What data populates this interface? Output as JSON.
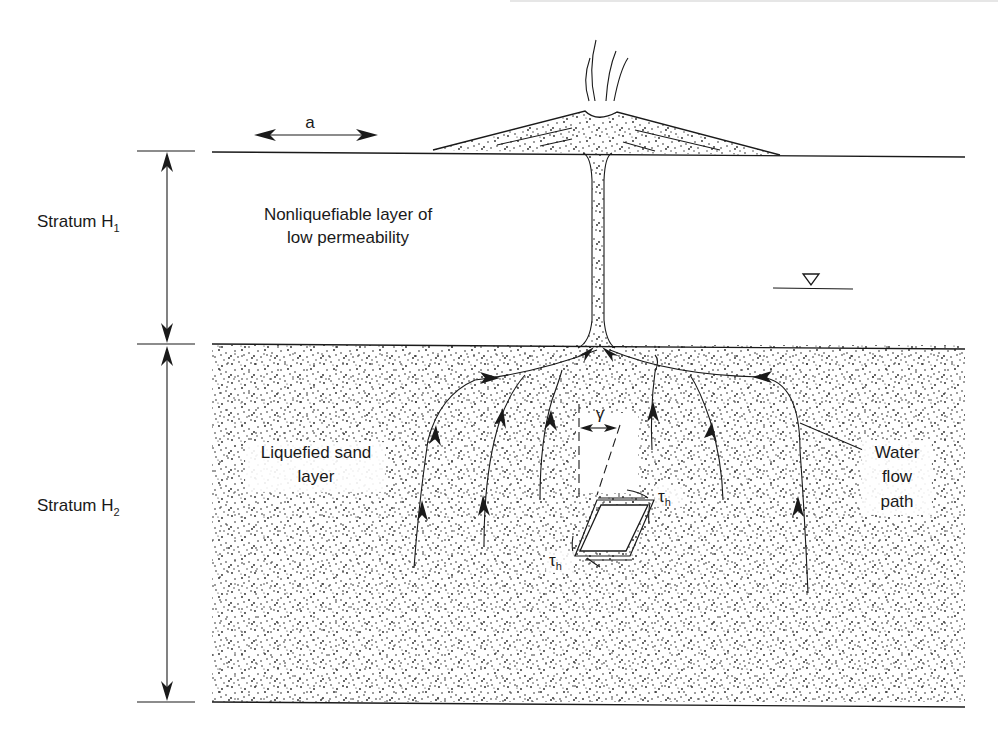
{
  "figure": {
    "type": "geotechnical cross-section"
  },
  "labels": {
    "width_dimension": "a",
    "stratum_h1": {
      "text": "Stratum H",
      "subscript": "1"
    },
    "stratum_h2": {
      "text": "Stratum H",
      "subscript": "2"
    },
    "upper_layer_line1": "Nonliquefiable layer of",
    "upper_layer_line2": "low permeability",
    "lower_layer_line1": "Liquefied sand",
    "lower_layer_line2": "layer",
    "water_flow_line1": "Water",
    "water_flow_line2": "flow",
    "water_flow_line3": "path",
    "shear_strain": "γ",
    "shear_stress_top": {
      "text": "τ",
      "subscript": "h"
    },
    "shear_stress_bottom": {
      "text": "τ",
      "subscript": "h"
    }
  },
  "symbols": {
    "water_table": "water-table-triangle"
  },
  "colors": {
    "ink": "#1a1a1a",
    "background": "#ffffff"
  }
}
